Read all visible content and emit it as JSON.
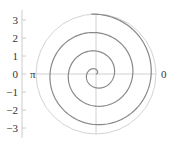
{
  "chart_data": {
    "type": "line",
    "subtype": "polar",
    "title": "",
    "y_axis": {
      "ticks": [
        "3",
        "2",
        "1",
        "0",
        "−1",
        "−2",
        "−3"
      ],
      "values": [
        3,
        2,
        1,
        0,
        -1,
        -2,
        -3
      ],
      "range": [
        -3.3,
        3.3
      ]
    },
    "angle_labels": {
      "left": "π",
      "right": "0"
    },
    "series": [
      {
        "name": "spiral",
        "equation": "r = theta",
        "theta_range": [
          0,
          20.5
        ],
        "turns": 3.25,
        "color": "#888888"
      }
    ],
    "grid": true,
    "legend": null
  },
  "colors": {
    "curve": "#888888",
    "grid": "#cccccc",
    "axis": "#bbbbbb",
    "text": "#333333"
  }
}
